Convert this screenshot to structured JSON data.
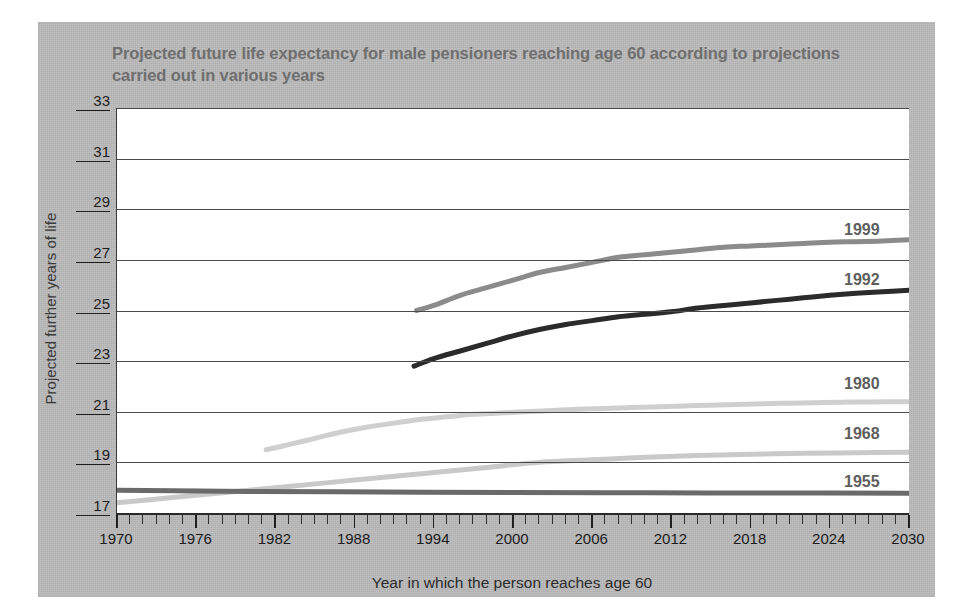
{
  "chart_data": {
    "type": "line",
    "title": "Projected future life expectancy for male pensioners reaching age 60 according to projections carried out in various years",
    "xlabel": "Year in which the person reaches age 60",
    "ylabel": "Projected further years of life",
    "xlim": [
      1970,
      2030
    ],
    "ylim": [
      17,
      33
    ],
    "xticks": [
      1970,
      1976,
      1982,
      1988,
      1994,
      2000,
      2006,
      2012,
      2018,
      2024,
      2030
    ],
    "yticks": [
      17,
      19,
      21,
      23,
      25,
      27,
      29,
      31,
      33
    ],
    "x_minor_tick_step": 1,
    "grid": "horizontal",
    "legend_position": "inline-right-of-series",
    "series": [
      {
        "name": "1999",
        "color": "#8b8b8b",
        "label": "1999",
        "x": [
          1992.7,
          1994,
          1996,
          1998,
          2000,
          2002,
          2004,
          2006,
          2008,
          2010,
          2012,
          2014,
          2016,
          2018,
          2020,
          2022,
          2024,
          2026,
          2028,
          2030
        ],
        "y": [
          25.0,
          25.2,
          25.6,
          25.9,
          26.2,
          26.5,
          26.7,
          26.9,
          27.1,
          27.2,
          27.3,
          27.4,
          27.5,
          27.55,
          27.6,
          27.65,
          27.7,
          27.72,
          27.75,
          27.8
        ]
      },
      {
        "name": "1992",
        "color": "#2b2b2b",
        "label": "1992",
        "x": [
          1992.5,
          1994,
          1996,
          1998,
          2000,
          2002,
          2004,
          2006,
          2008,
          2010,
          2012,
          2014,
          2016,
          2018,
          2020,
          2022,
          2024,
          2026,
          2028,
          2030
        ],
        "y": [
          22.8,
          23.1,
          23.4,
          23.7,
          24.0,
          24.25,
          24.45,
          24.6,
          24.75,
          24.85,
          24.95,
          25.1,
          25.2,
          25.3,
          25.4,
          25.5,
          25.6,
          25.68,
          25.74,
          25.8
        ]
      },
      {
        "name": "1980",
        "color": "#cfcfcf",
        "label": "1980",
        "x": [
          1981.3,
          1983,
          1985,
          1987,
          1989,
          1991,
          1993,
          1995,
          1997,
          1999,
          2001,
          2003,
          2005,
          2007,
          2009,
          2011,
          2013,
          2015,
          2017,
          2019,
          2021,
          2023,
          2025,
          2027,
          2030
        ],
        "y": [
          19.5,
          19.7,
          19.95,
          20.2,
          20.4,
          20.55,
          20.7,
          20.8,
          20.9,
          20.95,
          21.0,
          21.05,
          21.1,
          21.13,
          21.17,
          21.2,
          21.23,
          21.26,
          21.29,
          21.32,
          21.34,
          21.36,
          21.38,
          21.39,
          21.4
        ]
      },
      {
        "name": "1968",
        "color": "#c9c9c9",
        "label": "1968",
        "x": [
          1970,
          1974,
          1978,
          1982,
          1986,
          1990,
          1994,
          1998,
          2002,
          2006,
          2010,
          2014,
          2018,
          2022,
          2026,
          2030
        ],
        "y": [
          17.4,
          17.6,
          17.8,
          18.0,
          18.2,
          18.4,
          18.6,
          18.8,
          19.0,
          19.1,
          19.2,
          19.27,
          19.32,
          19.36,
          19.38,
          19.4
        ]
      },
      {
        "name": "1955",
        "color": "#6a6a6a",
        "label": "1955",
        "x": [
          1970,
          1980,
          1990,
          2000,
          2010,
          2020,
          2030
        ],
        "y": [
          17.9,
          17.85,
          17.83,
          17.81,
          17.8,
          17.79,
          17.78
        ]
      }
    ]
  },
  "series_labels": [
    {
      "text": "1999",
      "x": 844,
      "y": 221
    },
    {
      "text": "1992",
      "x": 844,
      "y": 271
    },
    {
      "text": "1980",
      "x": 844,
      "y": 375
    },
    {
      "text": "1968",
      "x": 844,
      "y": 425
    },
    {
      "text": "1955",
      "x": 844,
      "y": 473
    }
  ],
  "colors": {
    "panel_background": "#b9b9b9",
    "plot_background": "#ffffff",
    "title_text": "#6f6f6f",
    "axis_text": "#1d1d1d",
    "gridline": "#4a4a4a"
  }
}
